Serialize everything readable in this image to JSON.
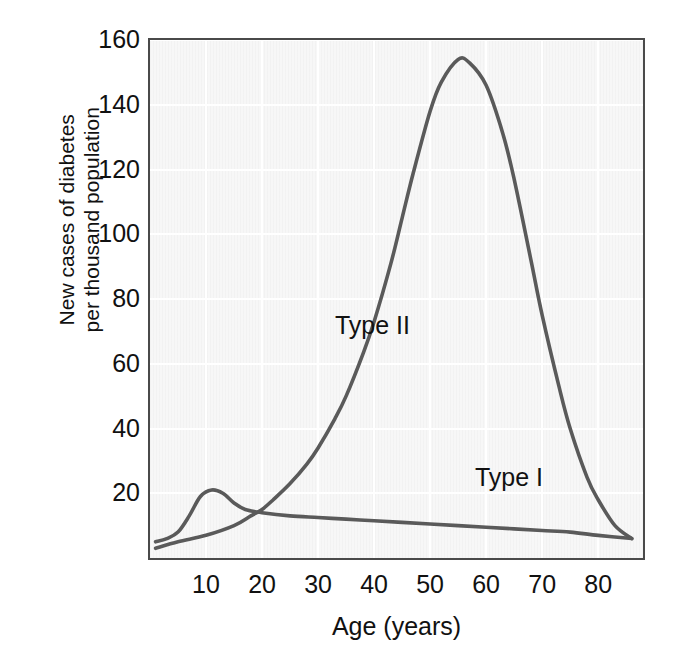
{
  "chart_data": {
    "type": "line",
    "title": "",
    "subtitle": "",
    "xlabel": "Age (years)",
    "ylabel_lines": [
      "New cases of diabetes",
      "per thousand population"
    ],
    "ylabel": "New cases of diabetes per thousand population",
    "xlim": [
      0,
      88
    ],
    "ylim": [
      0,
      160
    ],
    "xticks": [
      10,
      20,
      30,
      40,
      50,
      60,
      70,
      80
    ],
    "xtick_labels": [
      "10",
      "20",
      "30",
      "40",
      "50",
      "60",
      "70",
      "80"
    ],
    "yticks": [
      20,
      40,
      60,
      80,
      100,
      120,
      140,
      160
    ],
    "ytick_labels": [
      "20",
      "40",
      "60",
      "80",
      "100",
      "120",
      "140",
      "160"
    ],
    "grid": true,
    "grid_color": "#ffffff",
    "legend_position": "inline-annotations",
    "plot_background": "#f7f7f7",
    "frame_color": "#4a4a4a",
    "series": [
      {
        "name": "Type II",
        "label": "Type II",
        "color": "#5a5a5a",
        "annotation_x": 33,
        "annotation_y": 72,
        "x": [
          1,
          5,
          10,
          15,
          18,
          20,
          22,
          25,
          28,
          30,
          33,
          35,
          38,
          40,
          43,
          45,
          47,
          50,
          52,
          55,
          57,
          60,
          63,
          65,
          68,
          70,
          73,
          75,
          78,
          80,
          83,
          86
        ],
        "y": [
          3,
          5,
          7,
          10,
          13,
          15,
          18,
          23,
          29,
          34,
          43,
          50,
          63,
          73,
          91,
          105,
          119,
          138,
          147,
          154,
          153,
          146,
          131,
          117,
          92,
          75,
          53,
          40,
          25,
          18,
          10,
          6
        ]
      },
      {
        "name": "Type I",
        "label": "Type I",
        "color": "#5a5a5a",
        "annotation_x": 58,
        "annotation_y": 25,
        "x": [
          1,
          3,
          5,
          7,
          9,
          11,
          13,
          15,
          17,
          20,
          25,
          30,
          35,
          40,
          45,
          50,
          55,
          60,
          65,
          70,
          75,
          80,
          86
        ],
        "y": [
          5,
          6,
          8,
          13,
          19,
          21,
          20,
          17,
          15,
          14,
          13,
          12.5,
          12,
          11.5,
          11,
          10.5,
          10,
          9.5,
          9,
          8.5,
          8,
          7,
          6
        ]
      }
    ]
  },
  "axes": {
    "x_title": "Age (years)",
    "y_title_line1": "New cases of diabetes",
    "y_title_line2": "per thousand population"
  },
  "annotations": {
    "type2": "Type II",
    "type1": "Type I"
  }
}
